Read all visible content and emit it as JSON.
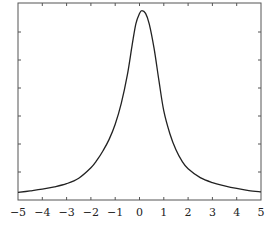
{
  "chart_data": {
    "type": "line",
    "title": "",
    "xlabel": "",
    "ylabel": "",
    "xlim": [
      -5,
      5
    ],
    "ylim": [
      0,
      1.04
    ],
    "grid": false,
    "legend": null,
    "x_ticks": [
      -5,
      -4,
      -3,
      -2,
      -1,
      0,
      1,
      2,
      3,
      4,
      5
    ],
    "x_tick_labels": [
      "−5",
      "−4",
      "−3",
      "−2",
      "−1",
      "0",
      "1",
      "2",
      "3",
      "4",
      "5"
    ],
    "y_ticks_count": 6,
    "y_tick_labels": [],
    "series": [
      {
        "name": "peak",
        "color": "#222222",
        "x": [
          -5,
          -4.5,
          -4,
          -3.5,
          -3,
          -2.5,
          -2,
          -1.75,
          -1.5,
          -1.25,
          -1,
          -0.75,
          -0.5,
          -0.3,
          -0.15,
          0,
          0.1,
          0.25,
          0.4,
          0.6,
          0.8,
          1,
          1.25,
          1.5,
          1.75,
          2,
          2.5,
          3,
          3.5,
          4,
          4.5,
          5
        ],
        "y": [
          0.04,
          0.048,
          0.057,
          0.069,
          0.086,
          0.115,
          0.17,
          0.21,
          0.26,
          0.32,
          0.4,
          0.51,
          0.66,
          0.82,
          0.93,
          0.985,
          1.0,
          0.985,
          0.93,
          0.8,
          0.63,
          0.47,
          0.35,
          0.265,
          0.205,
          0.165,
          0.118,
          0.092,
          0.075,
          0.061,
          0.05,
          0.043
        ]
      }
    ]
  }
}
